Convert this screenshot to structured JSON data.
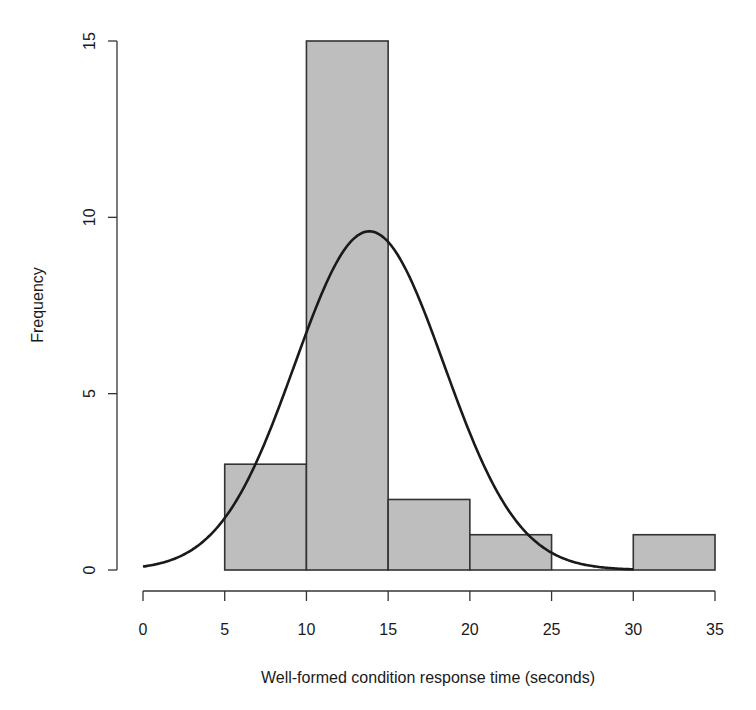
{
  "chart_data": {
    "type": "bar",
    "subtype": "histogram",
    "title": "",
    "xlabel": "Well-formed condition response time (seconds)",
    "ylabel": "Frequency",
    "bins": [
      {
        "start": 5,
        "end": 10,
        "count": 3
      },
      {
        "start": 10,
        "end": 15,
        "count": 15
      },
      {
        "start": 15,
        "end": 20,
        "count": 2
      },
      {
        "start": 20,
        "end": 25,
        "count": 1
      },
      {
        "start": 25,
        "end": 30,
        "count": 0
      },
      {
        "start": 30,
        "end": 35,
        "count": 1
      }
    ],
    "categories": [
      "5-10",
      "10-15",
      "15-20",
      "20-25",
      "25-30",
      "30-35"
    ],
    "values": [
      3,
      15,
      2,
      1,
      0,
      1
    ],
    "x_ticks": [
      0,
      5,
      10,
      15,
      20,
      25,
      30,
      35
    ],
    "y_ticks": [
      0,
      5,
      10,
      15
    ],
    "xlim": [
      0,
      35
    ],
    "ylim": [
      0,
      15
    ],
    "grid": false,
    "legend": null,
    "overlay_curve": {
      "type": "normal_density_scaled",
      "mean": 13.85,
      "sd": 4.57,
      "scale": 110,
      "x_range": [
        0,
        30
      ],
      "peak": 9.6
    },
    "colors": {
      "bar_fill": "#bebebe",
      "bar_edge": "#333333",
      "curve": "#1a1a1a",
      "axis": "#333333"
    }
  }
}
